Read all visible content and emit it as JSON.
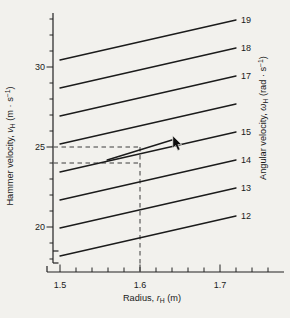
{
  "style": {
    "background": "#f2f1ed",
    "line_color": "#1b1b1b",
    "dash_color": "#3c3c3c",
    "text_color": "#1a1a1a"
  },
  "cursor": {
    "type": "mouse-arrow",
    "r": 1.641,
    "v": 25.7
  },
  "chart_data": {
    "type": "line",
    "title": "",
    "xlabel": "Radius, rH (m)",
    "ylabel": "Hammer velocity, vH (m · s−1)",
    "y2label": "Angular velocity, ωH (rad · s−1)",
    "xlabel_parts": [
      {
        "t": "Radius, "
      },
      {
        "t": "r",
        "style": "italic"
      },
      {
        "t": "H",
        "script": "sub"
      },
      {
        "t": " (m)"
      }
    ],
    "ylabel_parts": [
      {
        "t": "Hammer velocity, "
      },
      {
        "t": "v",
        "style": "italic"
      },
      {
        "t": "H",
        "script": "sub"
      },
      {
        "t": " (m · s"
      },
      {
        "t": "−1",
        "script": "sup"
      },
      {
        "t": ")"
      }
    ],
    "y2label_parts": [
      {
        "t": "Angular velocity, "
      },
      {
        "t": "ω",
        "style": "italic"
      },
      {
        "t": "H",
        "script": "sub"
      },
      {
        "t": " (rad · s"
      },
      {
        "t": "−1",
        "script": "sup"
      },
      {
        "t": ")"
      }
    ],
    "xlim": [
      1.49,
      1.78
    ],
    "ylim": [
      17.6,
      33.4
    ],
    "grid": false,
    "x_axis": {
      "major_ticks": [
        {
          "value": 1.5,
          "label": "1.5"
        },
        {
          "value": 1.6,
          "label": "1.6"
        },
        {
          "value": 1.7,
          "label": "1.7"
        }
      ],
      "minor_ticks": [
        1.52,
        1.54,
        1.56,
        1.58,
        1.62,
        1.64,
        1.66,
        1.68,
        1.72,
        1.74,
        1.76
      ]
    },
    "y_axis": {
      "major_ticks": [
        {
          "value": 20,
          "label": "20"
        },
        {
          "value": 25,
          "label": "25"
        },
        {
          "value": 30,
          "label": "30"
        }
      ],
      "minor_ticks": [
        18,
        19,
        21,
        22,
        23,
        24,
        26,
        27,
        28,
        29,
        31,
        32,
        33
      ]
    },
    "series": [
      {
        "label": "19",
        "omega": 19,
        "r": [
          1.5,
          1.72
        ],
        "v": [
          30.44,
          32.94
        ],
        "label_visible": true
      },
      {
        "label": "18",
        "omega": 18,
        "r": [
          1.5,
          1.72
        ],
        "v": [
          28.69,
          31.19
        ],
        "label_visible": true
      },
      {
        "label": "17",
        "omega": 17,
        "r": [
          1.5,
          1.72
        ],
        "v": [
          26.94,
          29.44
        ],
        "label_visible": true
      },
      {
        "label": "16",
        "omega": 16,
        "r": [
          1.5,
          1.72
        ],
        "v": [
          25.19,
          27.69
        ],
        "label_visible": false
      },
      {
        "label": "15",
        "omega": 15,
        "r": [
          1.5,
          1.72
        ],
        "v": [
          23.44,
          25.94
        ],
        "label_visible": true
      },
      {
        "label": "14",
        "omega": 14,
        "r": [
          1.5,
          1.72
        ],
        "v": [
          21.69,
          24.19
        ],
        "label_visible": true
      },
      {
        "label": "13",
        "omega": 13,
        "r": [
          1.5,
          1.72
        ],
        "v": [
          19.94,
          22.44
        ],
        "label_visible": true
      },
      {
        "label": "12",
        "omega": 12,
        "r": [
          1.5,
          1.72
        ],
        "v": [
          18.19,
          20.69
        ],
        "label_visible": true
      }
    ],
    "annotation_segment": {
      "note": "short unlabeled line between the 15 and 16 lines, passing through r=1.6, v=25",
      "r": [
        1.559,
        1.64
      ],
      "v": [
        24.19,
        25.44
      ]
    },
    "dashed_guides": {
      "horizontal_v": [
        25,
        24
      ],
      "vertical_r": [
        1.6
      ]
    }
  }
}
